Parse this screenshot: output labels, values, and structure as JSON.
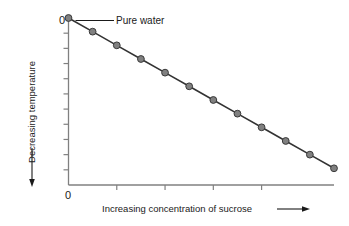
{
  "chart_data": {
    "type": "line",
    "title": "",
    "subtitle": "",
    "xlabel": "Increasing concentration of sucrose",
    "ylabel": "Decreasing temperature",
    "xlabel_arrow": "→",
    "ylabel_arrow": "↓",
    "x_origin_label": "0",
    "y_origin_label": "0",
    "grid": false,
    "legend": null,
    "xlim": [
      0,
      11
    ],
    "ylim": [
      -11,
      0
    ],
    "x_tick_count_interior": 4,
    "y_tick_count_interior": 10,
    "x_tick_values": [
      2,
      4,
      6,
      8
    ],
    "y_tick_values": [
      -1,
      -2,
      -3,
      -4,
      -5,
      -6,
      -7,
      -8,
      -9,
      -10
    ],
    "series": [
      {
        "name": "Freezing point of sucrose solution",
        "x": [
          0,
          1,
          2,
          3,
          4,
          5,
          6,
          7,
          8,
          9,
          10,
          11
        ],
        "values": [
          0,
          -0.9,
          -1.8,
          -2.7,
          -3.6,
          -4.5,
          -5.4,
          -6.3,
          -7.2,
          -8.1,
          -9.0,
          -9.9
        ],
        "marker": "circle",
        "marker_color": "#808080",
        "marker_edge_color": "#3a3a3a",
        "line_color": "#333333"
      }
    ],
    "annotations": [
      {
        "text": "Pure water",
        "points_to_x": 0,
        "points_to_y": 0,
        "leader": "horizontal-line"
      }
    ]
  },
  "style": {
    "background": "#ffffff",
    "axis_color": "#808080",
    "tick_color": "#808080",
    "text_color": "#1a1a1a",
    "marker_fill": "#808080",
    "marker_edge": "#3a3a3a",
    "line_color": "#333333"
  }
}
